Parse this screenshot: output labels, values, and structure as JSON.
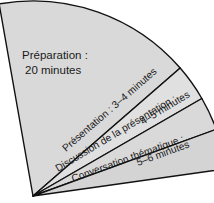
{
  "diagram": {
    "type": "fan-sector-diagram",
    "title": "",
    "background_color": "#ffffff",
    "outline_color": "#111111",
    "apex": {
      "x": 33,
      "y": 196
    },
    "radius": 195,
    "sectors": [
      {
        "id": "preparation",
        "name": "Préparation",
        "label_line1": "Préparation :",
        "label_line2": "20 minutes",
        "duration": "20 minutes",
        "duration_min": 20,
        "duration_max": 20,
        "fill_color": "#d9d9d9",
        "start_angle": -100,
        "end_angle": -41,
        "label_rotation": 0
      },
      {
        "id": "presentation",
        "name": "Présentation",
        "label_line1": "Présentation : 3–4 minutes",
        "label_line2": "",
        "duration": "3–4 minutes",
        "duration_min": 3,
        "duration_max": 4,
        "fill_color": "#e0e0e0",
        "start_angle": -41,
        "end_angle": -30,
        "label_rotation": -55
      },
      {
        "id": "discussion",
        "name": "Discussion de la présentation",
        "label_line1": "Discussion de la présentation :",
        "label_line2": "4–5 minutes",
        "duration": "4–5 minutes",
        "duration_min": 4,
        "duration_max": 5,
        "fill_color": "#d9d9d9",
        "start_angle": -30,
        "end_angle": -20,
        "label_rotation": -43
      },
      {
        "id": "conversation",
        "name": "Conversation thématique",
        "label_line1": "Conversation thématique :",
        "label_line2": "5–6 minutes",
        "duration": "5–6 minutes",
        "duration_min": 5,
        "duration_max": 6,
        "fill_color": "#d4d4d4",
        "start_angle": -20,
        "end_angle": -8,
        "label_rotation": -20
      }
    ]
  },
  "chart_data": {
    "type": "pie",
    "title": "",
    "categories": [
      "Préparation",
      "Présentation",
      "Discussion de la présentation",
      "Conversation thématique"
    ],
    "values": [
      20,
      3.5,
      4.5,
      5.5
    ],
    "value_labels": [
      "20 minutes",
      "3–4 minutes",
      "4–5 minutes",
      "5–6 minutes"
    ],
    "xlabel": "",
    "ylabel": "",
    "legend": "none",
    "grid": false
  }
}
